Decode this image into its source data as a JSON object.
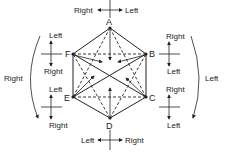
{
  "diagram": {
    "vertices": {
      "A": "A",
      "B": "B",
      "C": "C",
      "D": "D",
      "E": "E",
      "F": "F"
    },
    "top_axis": {
      "left": "Right",
      "right": "Left"
    },
    "bottom_axis": {
      "left": "Left",
      "right": "Right"
    },
    "f_axis": {
      "top": "Left",
      "bottom": "Right"
    },
    "e_axis": {
      "top": "Left",
      "bottom": "Right"
    },
    "b_axis": {
      "top": "Right",
      "bottom": "Left"
    },
    "c_axis": {
      "top": "Right",
      "bottom": "Left"
    },
    "left_arc_label": "Right",
    "right_arc_label": "Left",
    "solid_edges": [
      "A-B",
      "B-C",
      "C-D",
      "D-E",
      "E-F",
      "F-A",
      "F-C",
      "E-B"
    ],
    "dashed_edges": [
      "F-B",
      "E-C",
      "A-C",
      "A-E",
      "D-F",
      "D-B"
    ]
  }
}
